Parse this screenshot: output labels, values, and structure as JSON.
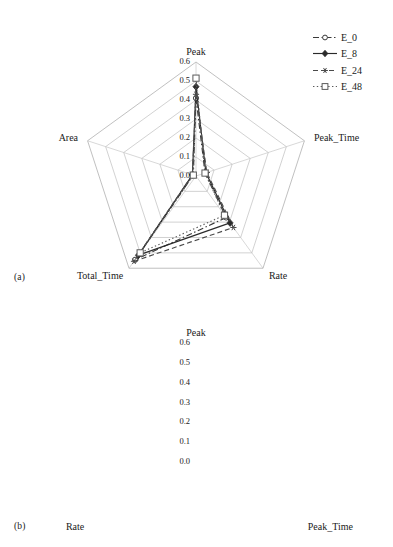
{
  "figure": {
    "panels": [
      {
        "id": "a",
        "caption": "(a)",
        "axes": [
          "Peak",
          "Peak_Time",
          "Rate",
          "Total_Time",
          "Area"
        ],
        "ticks": [
          "0.6",
          "0.5",
          "0.4",
          "0.3",
          "0.2",
          "0.1",
          "0.0"
        ]
      },
      {
        "id": "b",
        "caption": "(b)",
        "axes": [
          "Peak",
          "Peak_Time",
          "Rate"
        ],
        "ticks": [
          "0.6",
          "0.5",
          "0.4",
          "0.3",
          "0.2",
          "0.1",
          "0.0"
        ]
      }
    ],
    "legend": {
      "entries": [
        {
          "label": "E_0",
          "style": "dash-dot",
          "marker": "open-circle",
          "color": "#3a3a3a"
        },
        {
          "label": "E_8",
          "style": "solid",
          "marker": "filled-diamond",
          "color": "#2a2a2a"
        },
        {
          "label": "E_24",
          "style": "dashed",
          "marker": "star",
          "color": "#4a4a4a"
        },
        {
          "label": "E_48",
          "style": "dotted",
          "marker": "open-square",
          "color": "#5a5a5a"
        }
      ]
    },
    "colors": {
      "grid": "#b9b9b9",
      "spoke": "#c2c2c2",
      "text": "#1a1a1a",
      "background": "#ffffff"
    }
  },
  "chart_data": [
    {
      "type": "radar",
      "panel": "a",
      "title": "",
      "categories": [
        "Peak",
        "Peak_Time",
        "Rate",
        "Total_Time",
        "Area"
      ],
      "rlim": [
        0.0,
        0.6
      ],
      "rticks": [
        0.0,
        0.1,
        0.2,
        0.3,
        0.4,
        0.5,
        0.6
      ],
      "grid": true,
      "legend_position": "right",
      "series": [
        {
          "name": "E_0",
          "values": [
            0.41,
            0.05,
            0.27,
            0.545,
            0.015
          ]
        },
        {
          "name": "E_8",
          "values": [
            0.47,
            0.055,
            0.305,
            0.515,
            0.02
          ]
        },
        {
          "name": "E_24",
          "values": [
            0.43,
            0.06,
            0.335,
            0.555,
            0.02
          ]
        },
        {
          "name": "E_48",
          "values": [
            0.515,
            0.05,
            0.255,
            0.5,
            0.015
          ]
        }
      ]
    },
    {
      "type": "radar",
      "panel": "b",
      "title": "",
      "categories": [
        "Peak",
        "Peak_Time",
        "Rate"
      ],
      "rlim": [
        0.0,
        0.6
      ],
      "rticks": [
        0.0,
        0.1,
        0.2,
        0.3,
        0.4,
        0.5,
        0.6
      ],
      "grid": true,
      "legend_position": "right",
      "series": [
        {
          "name": "E_0",
          "values": [
            0.16,
            0.575,
            0.005
          ]
        },
        {
          "name": "E_8",
          "values": [
            0.16,
            0.58,
            0.005
          ]
        },
        {
          "name": "E_24",
          "values": [
            0.16,
            0.575,
            0.005
          ]
        },
        {
          "name": "E_48",
          "values": [
            0.165,
            0.57,
            0.005
          ]
        }
      ]
    }
  ]
}
